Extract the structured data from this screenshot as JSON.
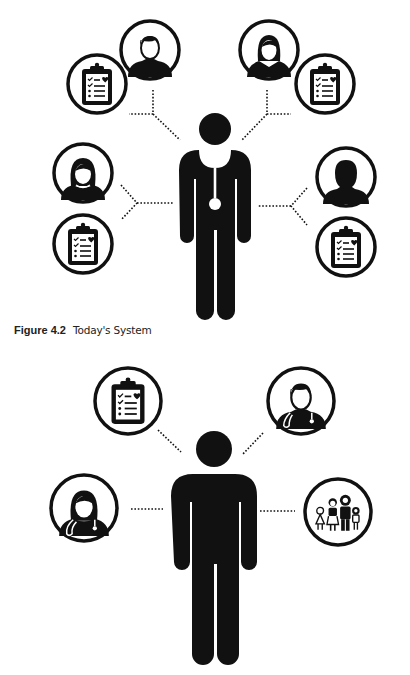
{
  "figures": [
    {
      "id": "figure-4-2",
      "caption_label": "Figure 4.2",
      "caption_title": "Today's System",
      "center": "doctor",
      "nodes": [
        {
          "icon": "patient-male-icon",
          "position": "top-left"
        },
        {
          "icon": "clipboard-icon",
          "position": "upper-left"
        },
        {
          "icon": "patient-female-icon",
          "position": "top-right"
        },
        {
          "icon": "clipboard-icon",
          "position": "upper-right"
        },
        {
          "icon": "patient-female-icon",
          "position": "middle-left"
        },
        {
          "icon": "clipboard-icon",
          "position": "lower-left"
        },
        {
          "icon": "patient-person-icon",
          "position": "middle-right"
        },
        {
          "icon": "clipboard-icon",
          "position": "lower-right"
        }
      ]
    },
    {
      "id": "figure-4-3",
      "center": "patient",
      "nodes": [
        {
          "icon": "clipboard-icon",
          "position": "top-left"
        },
        {
          "icon": "doctor-male-icon",
          "position": "top-right"
        },
        {
          "icon": "doctor-female-icon",
          "position": "left"
        },
        {
          "icon": "family-icon",
          "position": "right"
        }
      ]
    }
  ],
  "colors": {
    "ink": "#111111",
    "background": "#ffffff"
  }
}
